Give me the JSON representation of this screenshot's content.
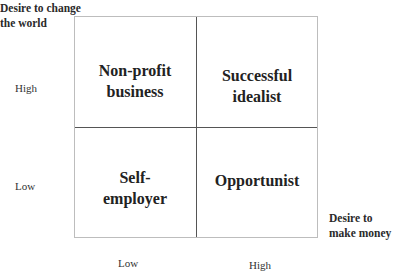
{
  "y_axis": {
    "title_line1": "Desire to change",
    "title_line2": "the world",
    "high": "High",
    "low": "Low"
  },
  "x_axis": {
    "title_line1": "Desire to",
    "title_line2": "make money",
    "low": "Low",
    "high": "High"
  },
  "quadrants": {
    "top_left": {
      "line1": "Non-profit",
      "line2": "business"
    },
    "top_right": {
      "line1": "Successful",
      "line2": "idealist"
    },
    "bottom_left": {
      "line1": "Self-",
      "line2": "employer"
    },
    "bottom_right": {
      "line1": "Opportunist",
      "line2": ""
    }
  }
}
